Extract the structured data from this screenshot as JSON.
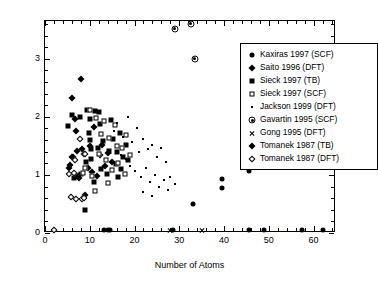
{
  "chart_data": {
    "type": "scatter",
    "title": "",
    "xlabel": "Number of Atoms",
    "ylabel": "Energy Gap (eV)",
    "xlim": [
      0,
      65
    ],
    "ylim": [
      0,
      3.65
    ],
    "xticks": [
      0,
      10,
      20,
      30,
      40,
      50,
      60
    ],
    "yticks": [
      0,
      1,
      2,
      3
    ],
    "xtick_labels": [
      "0",
      "10",
      "20",
      "30",
      "40",
      "50",
      "60"
    ],
    "ytick_labels": [
      "0",
      "1",
      "2",
      "3"
    ],
    "xminor_step": 2,
    "yminor_step": 0.2,
    "grid": false,
    "legend_position": "upper right",
    "series": [
      {
        "name": "Kaxiras 1997 (SCF)",
        "marker": "filled-circle",
        "points": [
          [
            33.0,
            0.5
          ],
          [
            39.5,
            0.78
          ],
          [
            39.5,
            0.93
          ],
          [
            45.5,
            1.07
          ],
          [
            45.5,
            0.05
          ],
          [
            49.0,
            0.05
          ],
          [
            57.5,
            0.05
          ],
          [
            62.0,
            0.05
          ],
          [
            28.5,
            0.05
          ],
          [
            14.0,
            0.05
          ],
          [
            14.6,
            0.05
          ],
          [
            13.2,
            0.05
          ]
        ]
      },
      {
        "name": "Saito 1996 (DFT)",
        "marker": "filled-diamond",
        "points": [
          [
            6.0,
            2.32
          ],
          [
            8.0,
            2.66
          ],
          [
            7.0,
            1.75
          ],
          [
            7.2,
            1.42
          ],
          [
            6.2,
            1.3
          ],
          [
            9.0,
            0.66
          ],
          [
            10.0,
            1.5
          ],
          [
            11.0,
            1.82
          ],
          [
            8.6,
            1.36
          ],
          [
            12.3,
            1.34
          ],
          [
            12.8,
            1.52
          ],
          [
            14.0,
            1.38
          ],
          [
            5.6,
            1.17
          ],
          [
            9.6,
            1.12
          ],
          [
            10.4,
            1.05
          ],
          [
            11.6,
            0.98
          ],
          [
            7.6,
            0.95
          ],
          [
            13.4,
            1.16
          ],
          [
            6.6,
            1.96
          ],
          [
            15.0,
            1.22
          ]
        ]
      },
      {
        "name": "Sieck 1997 (TB)",
        "marker": "filled-square",
        "points": [
          [
            5.2,
            1.84
          ],
          [
            6.0,
            2.04
          ],
          [
            9.4,
            2.12
          ],
          [
            10.0,
            1.96
          ],
          [
            9.8,
            1.72
          ],
          [
            10.1,
            1.6
          ],
          [
            10.2,
            1.44
          ],
          [
            10.3,
            1.28
          ],
          [
            11.2,
            2.1
          ],
          [
            12.0,
            2.08
          ],
          [
            8.0,
            1.02
          ],
          [
            9.0,
            0.4
          ],
          [
            6.4,
            0.95
          ],
          [
            13.0,
            1.58
          ],
          [
            14.2,
            1.42
          ],
          [
            15.2,
            1.62
          ],
          [
            16.0,
            1.4
          ],
          [
            12.5,
            1.1
          ],
          [
            13.8,
            1.02
          ],
          [
            15.8,
            1.18
          ],
          [
            11.0,
            0.88
          ],
          [
            16.8,
            1.72
          ],
          [
            17.4,
            1.3
          ],
          [
            18.0,
            1.52
          ],
          [
            7.8,
            2.0
          ],
          [
            12.2,
            1.88
          ],
          [
            14.8,
            1.94
          ],
          [
            17.0,
            1.1
          ],
          [
            9.2,
            1.22
          ],
          [
            11.8,
            1.46
          ],
          [
            16.2,
            0.96
          ],
          [
            18.6,
            1.26
          ]
        ]
      },
      {
        "name": "Sieck 1997 (SCF)",
        "marker": "open-square",
        "points": [
          [
            10.0,
            2.12
          ],
          [
            9.0,
            1.12
          ],
          [
            11.4,
            1.98
          ],
          [
            12.6,
            1.7
          ],
          [
            13.2,
            1.92
          ],
          [
            14.4,
            1.64
          ],
          [
            15.6,
            1.86
          ],
          [
            16.4,
            1.2
          ],
          [
            12.0,
            1.36
          ],
          [
            13.6,
            1.26
          ],
          [
            10.6,
            0.98
          ],
          [
            17.2,
            1.46
          ],
          [
            18.2,
            1.68
          ],
          [
            11.2,
            0.72
          ],
          [
            15.0,
            1.08
          ],
          [
            16.0,
            1.5
          ],
          [
            8.4,
            1.04
          ],
          [
            14.0,
            0.86
          ],
          [
            17.8,
            1.02
          ],
          [
            19.0,
            1.34
          ]
        ]
      },
      {
        "name": "Jackson 1999 (DFT)",
        "marker": "small-dot",
        "points": [
          [
            16.0,
            1.9
          ],
          [
            17.5,
            1.66
          ],
          [
            18.5,
            2.0
          ],
          [
            19.5,
            1.56
          ],
          [
            20.5,
            1.8
          ],
          [
            21.0,
            1.4
          ],
          [
            22.0,
            1.62
          ],
          [
            23.0,
            1.44
          ],
          [
            24.0,
            1.52
          ],
          [
            25.0,
            1.3
          ],
          [
            26.0,
            1.46
          ],
          [
            27.0,
            1.22
          ],
          [
            19.0,
            1.16
          ],
          [
            20.0,
            1.06
          ],
          [
            21.5,
            0.96
          ],
          [
            22.5,
            1.12
          ],
          [
            23.5,
            0.88
          ],
          [
            24.5,
            1.0
          ],
          [
            25.5,
            0.8
          ],
          [
            26.5,
            0.92
          ],
          [
            18.0,
            1.28
          ],
          [
            27.5,
            0.74
          ],
          [
            28.0,
            0.96
          ],
          [
            29.0,
            0.84
          ],
          [
            15.5,
            1.76
          ],
          [
            17.0,
            1.34
          ],
          [
            22.0,
            0.7
          ],
          [
            24.0,
            0.64
          ]
        ]
      },
      {
        "name": "Gavartin 1995 (SCF)",
        "marker": "circled-dot",
        "points": [
          [
            29.0,
            3.52
          ],
          [
            32.5,
            3.6
          ],
          [
            33.5,
            3.0
          ]
        ]
      },
      {
        "name": "Gong 1995 (DFT)",
        "marker": "cross",
        "points": [
          [
            28.0,
            0.05
          ],
          [
            35.0,
            0.05
          ]
        ]
      },
      {
        "name": "Tomanek 1987 (TB)",
        "marker": "filled-diamond",
        "points": [
          [
            6.0,
            1.3
          ],
          [
            7.4,
            0.98
          ],
          [
            8.2,
            1.44
          ],
          [
            5.4,
            1.12
          ]
        ]
      },
      {
        "name": "Tomanek 1987 (DFT)",
        "marker": "open-diamond",
        "points": [
          [
            5.4,
            1.02
          ],
          [
            6.4,
            1.04
          ],
          [
            7.0,
            0.58
          ],
          [
            8.2,
            0.58
          ],
          [
            9.0,
            1.36
          ],
          [
            6.8,
            1.26
          ],
          [
            7.8,
            1.62
          ],
          [
            5.8,
            0.62
          ],
          [
            2.0,
            0.05
          ],
          [
            8.6,
            0.6
          ]
        ]
      }
    ]
  },
  "legend": {
    "entries": [
      {
        "label": "Kaxiras 1997 (SCF)",
        "marker": "filled-circle"
      },
      {
        "label": "Saito 1996 (DFT)",
        "marker": "filled-diamond"
      },
      {
        "label": "Sieck 1997 (TB)",
        "marker": "filled-square"
      },
      {
        "label": "Sieck 1997 (SCF)",
        "marker": "open-square"
      },
      {
        "label": "Jackson 1999 (DFT)",
        "marker": "small-dot"
      },
      {
        "label": "Gavartin 1995 (SCF)",
        "marker": "circled-dot"
      },
      {
        "label": "Gong 1995 (DFT)",
        "marker": "cross"
      },
      {
        "label": "Tomanek 1987 (TB)",
        "marker": "filled-diamond"
      },
      {
        "label": "Tomanek 1987 (DFT)",
        "marker": "open-diamond"
      }
    ]
  },
  "colors": {
    "foreground": "#000000",
    "background": "#ffffff"
  }
}
